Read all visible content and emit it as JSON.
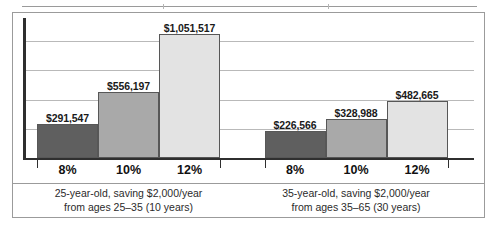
{
  "figure": {
    "background": "#ffffff",
    "frame_color": "#9b9b9b",
    "axis_color": "#2f2f2f",
    "grid_color": "#b9b9b9"
  },
  "chart_data": {
    "type": "bar",
    "title": "",
    "subtitle": "",
    "xlabel": "",
    "ylabel": "",
    "grid": true,
    "legend": "none",
    "ylim": [
      0,
      1200000
    ],
    "gridline_values": [
      1000000,
      750000,
      500000,
      250000
    ],
    "categories": [
      "8%",
      "10%",
      "12%"
    ],
    "groups": [
      {
        "name": "25-year-old",
        "caption_line1": "25-year-old, saving $2,000/year",
        "caption_line2": "from ages 25–35 (10 years)",
        "bars": [
          {
            "category": "8%",
            "value": 291547,
            "label": "$291,547",
            "color": "#5f5f5f"
          },
          {
            "category": "10%",
            "value": 556197,
            "label": "$556,197",
            "color": "#a9a9a9"
          },
          {
            "category": "12%",
            "value": 1051517,
            "label": "$1,051,517",
            "color": "#e3e3e3"
          }
        ]
      },
      {
        "name": "35-year-old",
        "caption_line1": "35-year-old, saving $2,000/year",
        "caption_line2": "from ages 35–65 (30 years)",
        "bars": [
          {
            "category": "8%",
            "value": 226566,
            "label": "$226,566",
            "color": "#5f5f5f"
          },
          {
            "category": "10%",
            "value": 328988,
            "label": "$328,988",
            "color": "#a9a9a9"
          },
          {
            "category": "12%",
            "value": 482665,
            "label": "$482,665",
            "color": "#e3e3e3"
          }
        ]
      }
    ]
  }
}
